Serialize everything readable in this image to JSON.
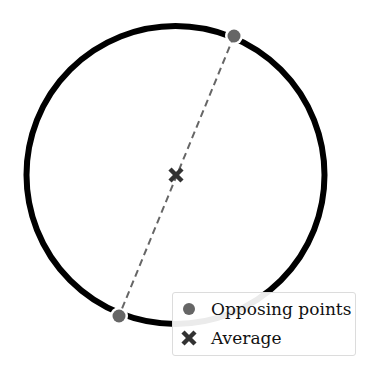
{
  "figure": {
    "type": "diagram",
    "circle": {
      "cx": 175.5,
      "cy": 175,
      "r": 149,
      "stroke": "#000000",
      "stroke_width": 6
    },
    "opposing_points": [
      {
        "x": 234,
        "y": 36
      },
      {
        "x": 119,
        "y": 316
      }
    ],
    "average_point": {
      "x": 176,
      "y": 175
    },
    "colors": {
      "point": "#666666",
      "dashed_line": "#666666",
      "average_marker": "#333333",
      "circle": "#000000"
    }
  },
  "legend": {
    "items": [
      {
        "label": "Opposing points",
        "marker": "circle-marker"
      },
      {
        "label": "Average",
        "marker": "x-marker"
      }
    ]
  }
}
